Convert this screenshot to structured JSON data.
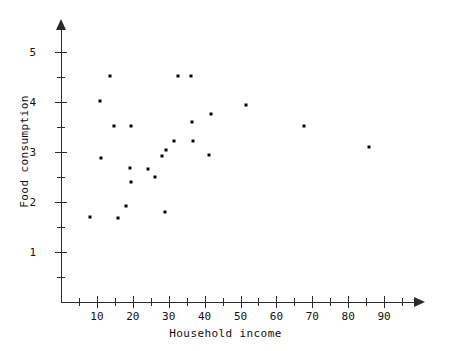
{
  "chart_data": {
    "type": "scatter",
    "title": "",
    "xlabel": "Household income",
    "ylabel": "Food consumption",
    "xlim": [
      0,
      99
    ],
    "ylim": [
      0,
      5.5
    ],
    "grid": false,
    "legend": null,
    "x_ticks": [
      10,
      20,
      30,
      40,
      50,
      60,
      70,
      80,
      90
    ],
    "x_tick_labels": [
      "10",
      "20",
      "30",
      "40",
      "50",
      "60",
      "70",
      "80",
      "90"
    ],
    "x_minor_ticks": [
      5,
      15,
      25,
      35,
      45,
      55,
      65,
      75,
      85,
      95
    ],
    "y_ticks": [
      1,
      2,
      3,
      4,
      5
    ],
    "y_tick_labels": [
      "1",
      "2",
      "3",
      "4",
      "5"
    ],
    "y_minor_ticks": [
      0.5,
      1.5,
      2.5,
      3.5,
      4.5,
      5.5
    ],
    "marker": "square",
    "marker_color": "#000000",
    "axis_color": "#2b2b2b",
    "points": [
      {
        "x": 8.1,
        "y": 1.7
      },
      {
        "x": 10.9,
        "y": 4.02
      },
      {
        "x": 11.1,
        "y": 2.88
      },
      {
        "x": 13.6,
        "y": 4.52
      },
      {
        "x": 14.8,
        "y": 3.52
      },
      {
        "x": 15.9,
        "y": 1.68
      },
      {
        "x": 18.1,
        "y": 1.92
      },
      {
        "x": 19.2,
        "y": 2.68
      },
      {
        "x": 19.5,
        "y": 3.53
      },
      {
        "x": 19.6,
        "y": 2.4
      },
      {
        "x": 24.2,
        "y": 2.67
      },
      {
        "x": 26.2,
        "y": 2.5
      },
      {
        "x": 28.1,
        "y": 2.92
      },
      {
        "x": 28.9,
        "y": 1.8
      },
      {
        "x": 29.3,
        "y": 3.04
      },
      {
        "x": 31.5,
        "y": 3.22
      },
      {
        "x": 32.6,
        "y": 4.52
      },
      {
        "x": 36.2,
        "y": 4.52
      },
      {
        "x": 36.5,
        "y": 3.61
      },
      {
        "x": 36.8,
        "y": 3.22
      },
      {
        "x": 41.3,
        "y": 2.95
      },
      {
        "x": 41.8,
        "y": 3.77
      },
      {
        "x": 51.5,
        "y": 3.94
      },
      {
        "x": 67.8,
        "y": 3.52
      },
      {
        "x": 85.8,
        "y": 3.1
      }
    ]
  }
}
